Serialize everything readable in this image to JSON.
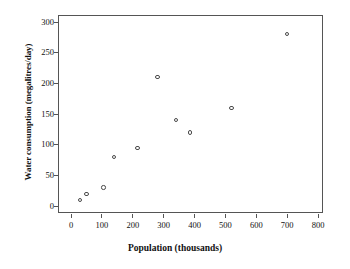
{
  "chart_data": {
    "type": "scatter",
    "title": "",
    "xlabel": "Population (thousands)",
    "ylabel": "Water consumption (megalitres/day)",
    "xlim": [
      -40,
      840
    ],
    "ylim": [
      -18,
      318
    ],
    "xticks": [
      0,
      100,
      200,
      300,
      400,
      500,
      600,
      700,
      800
    ],
    "xtick_labels": [
      "0",
      "100",
      "200",
      "300",
      "400",
      "500",
      "600",
      "700",
      "800"
    ],
    "yticks": [
      0,
      50,
      100,
      150,
      200,
      250,
      300
    ],
    "ytick_labels": [
      "0",
      "50",
      "100",
      "150",
      "200",
      "250",
      "300"
    ],
    "grid": false,
    "legend": false,
    "marker": "open-circle",
    "marker_color": "#4a4a4a",
    "x": [
      30,
      50,
      105,
      140,
      215,
      280,
      340,
      385,
      520,
      700
    ],
    "y": [
      10,
      20,
      30,
      80,
      95,
      210,
      140,
      120,
      160,
      280
    ],
    "points": [
      {
        "x": 30,
        "y": 10
      },
      {
        "x": 50,
        "y": 20
      },
      {
        "x": 105,
        "y": 30
      },
      {
        "x": 140,
        "y": 80
      },
      {
        "x": 215,
        "y": 95
      },
      {
        "x": 280,
        "y": 210
      },
      {
        "x": 340,
        "y": 140
      },
      {
        "x": 385,
        "y": 120
      },
      {
        "x": 520,
        "y": 160
      },
      {
        "x": 700,
        "y": 280
      }
    ]
  }
}
